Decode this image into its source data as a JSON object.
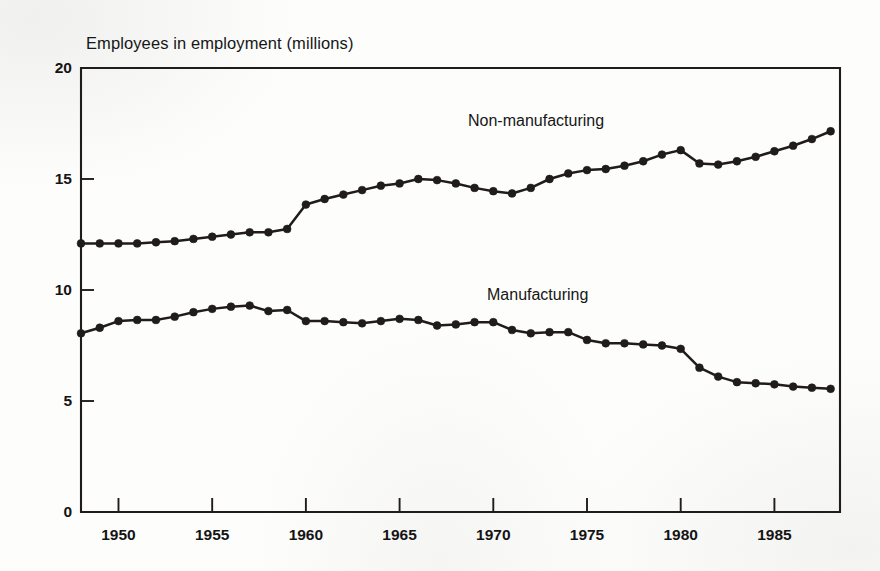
{
  "figure": {
    "title": "Employees in employment (millions)",
    "background_color": "#fdfdfc",
    "ink_color": "#1f1c1b"
  },
  "annotations": {
    "non_manufacturing": "Non-manufacturing",
    "manufacturing": "Manufacturing"
  },
  "axes": {
    "y_ticks": [
      "0",
      "5",
      "10",
      "15",
      "20"
    ],
    "x_ticks": [
      "1950",
      "1955",
      "1960",
      "1965",
      "1970",
      "1975",
      "1980",
      "1985"
    ]
  },
  "chart_data": {
    "type": "line",
    "title": "Employees in employment (millions)",
    "xlabel": "",
    "ylabel": "Employees in employment (millions)",
    "xlim": [
      1948,
      1988.5
    ],
    "ylim": [
      0,
      20
    ],
    "grid": false,
    "legend_position": "inline-annotations",
    "x_tick_values": [
      1950,
      1955,
      1960,
      1965,
      1970,
      1975,
      1980,
      1985
    ],
    "y_tick_values": [
      0,
      5,
      10,
      15,
      20
    ],
    "marker": "filled-circle",
    "x": [
      1948,
      1949,
      1950,
      1951,
      1952,
      1953,
      1954,
      1955,
      1956,
      1957,
      1958,
      1959,
      1960,
      1961,
      1962,
      1963,
      1964,
      1965,
      1966,
      1967,
      1968,
      1969,
      1970,
      1971,
      1972,
      1973,
      1974,
      1975,
      1976,
      1977,
      1978,
      1979,
      1980,
      1981,
      1982,
      1983,
      1984,
      1985,
      1986,
      1987,
      1988
    ],
    "series": [
      {
        "name": "Non-manufacturing",
        "values": [
          12.1,
          12.1,
          12.1,
          12.1,
          12.15,
          12.2,
          12.3,
          12.4,
          12.5,
          12.6,
          12.6,
          12.75,
          13.85,
          14.1,
          14.3,
          14.5,
          14.7,
          14.8,
          15.0,
          14.95,
          14.8,
          14.6,
          14.45,
          14.35,
          14.6,
          15.0,
          15.25,
          15.4,
          15.45,
          15.6,
          15.8,
          16.1,
          16.3,
          15.7,
          15.65,
          15.8,
          16.0,
          16.25,
          16.5,
          16.8,
          17.15
        ]
      },
      {
        "name": "Manufacturing",
        "values": [
          8.05,
          8.3,
          8.6,
          8.65,
          8.65,
          8.8,
          9.0,
          9.15,
          9.25,
          9.3,
          9.05,
          9.1,
          8.6,
          8.6,
          8.55,
          8.5,
          8.6,
          8.7,
          8.65,
          8.4,
          8.45,
          8.55,
          8.55,
          8.2,
          8.05,
          8.1,
          8.1,
          7.75,
          7.6,
          7.6,
          7.55,
          7.5,
          7.35,
          6.5,
          6.1,
          5.85,
          5.8,
          5.75,
          5.65,
          5.6,
          5.55
        ]
      }
    ]
  }
}
